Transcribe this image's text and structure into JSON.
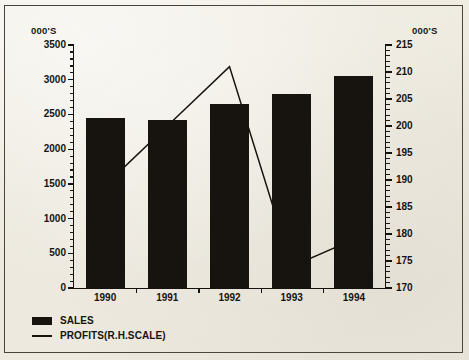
{
  "chart_data": {
    "type": "bar",
    "title": "",
    "categories": [
      "1990",
      "1991",
      "1992",
      "1993",
      "1994"
    ],
    "left_axis": {
      "unit_label": "000'S",
      "ylim": [
        0,
        3500
      ],
      "ticks": [
        0,
        500,
        1000,
        1500,
        2000,
        2500,
        3000,
        3500
      ],
      "tick_labels": [
        "0",
        "500",
        "1000",
        "1500",
        "2000",
        "2500",
        "3000",
        "3500"
      ],
      "minor_tick_step": 100
    },
    "right_axis": {
      "unit_label": "000'S",
      "ylim": [
        170,
        215
      ],
      "ticks": [
        170,
        175,
        180,
        185,
        190,
        195,
        200,
        205,
        210,
        215
      ],
      "tick_labels": [
        "170",
        "175",
        "180",
        "185",
        "190",
        "195",
        "200",
        "205",
        "210",
        "215"
      ],
      "minor_tick_step": 1
    },
    "series": [
      {
        "name": "SALES",
        "type": "bar",
        "axis": "left",
        "color": "#17130f",
        "values": [
          2450,
          2420,
          2650,
          2800,
          3050
        ]
      },
      {
        "name": "PROFITS(R.H.SCALE)",
        "type": "line",
        "axis": "right",
        "color": "#17130f",
        "values": [
          189,
          200,
          211,
          174,
          179
        ]
      }
    ],
    "xlabel": "",
    "ylabel": "",
    "grid": false,
    "legend_position": "bottom-left"
  },
  "legend": {
    "entries": [
      {
        "label": "SALES",
        "marker": "filled-square"
      },
      {
        "label": "PROFITS(R.H.SCALE)",
        "marker": "line"
      }
    ]
  }
}
